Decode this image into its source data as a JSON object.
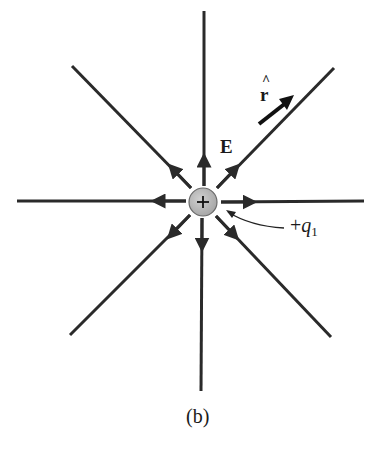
{
  "diagram": {
    "type": "electric-field-lines-point-charge",
    "charge": {
      "sign": "+",
      "label_prefix": "+",
      "label_var": "q",
      "label_sub": "1",
      "fill": "#bdbdbd",
      "stroke": "#555555"
    },
    "field_label": "E",
    "unit_vector_label": "r",
    "unit_vector_hat": "^",
    "caption": "(b)",
    "line_color": "#2a2a2a",
    "center": [
      203,
      202
    ],
    "field_lines": [
      {
        "direction": "up",
        "end": [
          204,
          11
        ]
      },
      {
        "direction": "down",
        "end": [
          201,
          391
        ]
      },
      {
        "direction": "left",
        "end": [
          17,
          201
        ]
      },
      {
        "direction": "right",
        "end": [
          364,
          201
        ]
      },
      {
        "direction": "up-left",
        "end": [
          72,
          66
        ]
      },
      {
        "direction": "up-right",
        "end": [
          334,
          68
        ]
      },
      {
        "direction": "down-left",
        "end": [
          70,
          335
        ]
      },
      {
        "direction": "down-right",
        "end": [
          331,
          337
        ]
      }
    ]
  }
}
